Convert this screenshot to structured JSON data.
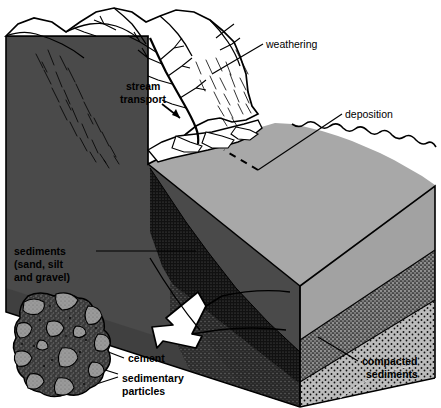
{
  "figure": {
    "background_color": "#ffffff",
    "line_color": "#000000"
  },
  "labels": {
    "weathering": "weathering",
    "stream_transport_line1": "stream",
    "stream_transport_line2": "transport",
    "deposition": "deposition",
    "sediments_line1": "sediments",
    "sediments_line2": "(sand, silt",
    "sediments_line3": "and gravel)",
    "cement": "cement",
    "sedimentary_particles_line1": "sedimentary",
    "sedimentary_particles_line2": "particles",
    "compacted_line1": "compacted",
    "compacted_line2": "sediments"
  },
  "colors": {
    "mountain_fill": "#ffffff",
    "left_face_dark": "#4a4a4a",
    "top_surface_gray": "#a8a8a8",
    "front_face_gray": "#9e9e9e",
    "dark_wedge": "#1c1c1c",
    "stipple_mid": "#8f8f8f",
    "stipple_low": "#b4b4b4",
    "right_face_gray": "#8c8c8c",
    "rock_dark": "#3c3c3c",
    "rock_grain": "#8a8a8a",
    "outline": "#000000"
  },
  "regions": [
    {
      "name": "mountain-range",
      "description": "White eroded mountain massif at upper left with dendritic stream valleys"
    },
    {
      "name": "left-block-face",
      "description": "Dark gray left-hand cut face of the block"
    },
    {
      "name": "top-surface",
      "description": "Medium gray depositional plain / top surface of the block"
    },
    {
      "name": "front-face",
      "description": "Front cut face showing sediment layers"
    },
    {
      "name": "dark-wedge-layer",
      "description": "Black stippled coarse sediment wedge near the mountain front"
    },
    {
      "name": "compacted-layer",
      "description": "Stippled lower layers of compacted sediments"
    },
    {
      "name": "rock-inset",
      "description": "Magnified conglomerate rock showing cement and sedimentary particles"
    }
  ]
}
